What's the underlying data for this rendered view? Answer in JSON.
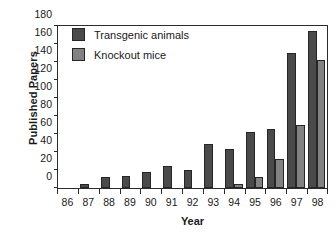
{
  "chart_data": {
    "type": "bar",
    "title": "",
    "xlabel": "Year",
    "ylabel": "Published Papers",
    "categories": [
      "86",
      "87",
      "88",
      "89",
      "90",
      "91",
      "92",
      "93",
      "94",
      "95",
      "96",
      "97",
      "98"
    ],
    "series": [
      {
        "name": "Transgenic animals",
        "color": "#4a4a4a",
        "values": [
          0,
          5,
          12,
          13,
          18,
          24,
          20,
          49,
          43,
          62,
          66,
          150,
          174
        ]
      },
      {
        "name": "Knockout mice",
        "color": "#828282",
        "values": [
          0,
          0,
          0,
          0,
          0,
          0,
          0,
          0,
          4,
          12,
          32,
          70,
          142
        ]
      }
    ],
    "ylim": [
      0,
      180
    ],
    "yticks": [
      0,
      20,
      40,
      60,
      80,
      100,
      120,
      140,
      160,
      180
    ],
    "ytick_labels": [
      "0",
      "20",
      "40",
      "60",
      "80",
      "100",
      "120",
      "140",
      "160",
      "180"
    ],
    "grid": false,
    "legend_position": "upper-left",
    "legend": [
      {
        "label": "Transgenic animals",
        "color": "#4a4a4a"
      },
      {
        "label": "Knockout mice",
        "color": "#828282"
      }
    ]
  }
}
